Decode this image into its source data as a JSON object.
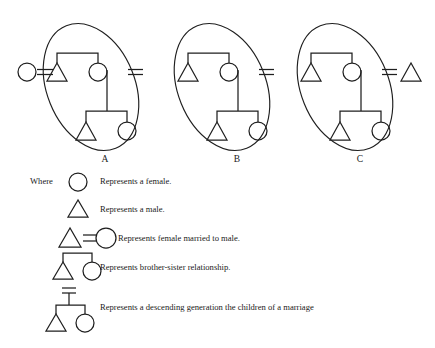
{
  "figure": {
    "title_visible": false,
    "background_color": "#ffffff",
    "stroke_color": "#1f1f1f"
  },
  "diagrams": [
    {
      "label": "A",
      "label_x": 105,
      "label_y": 160,
      "ellipse": {
        "cx": 91,
        "cy": 87,
        "rx": 44,
        "ry": 66,
        "rotate": -22
      },
      "external_spouse": {
        "symbol": "female-circle",
        "position": "left",
        "cx": 27,
        "cy": 72,
        "r": 9
      },
      "marriage_link_left": {
        "x1": 36,
        "x2": 54,
        "y": 72
      },
      "marriage_link_right": {
        "x1": 128,
        "x2": 142,
        "y": 72
      },
      "inside": {
        "sibling_bar": {
          "x1": 57,
          "x2": 98,
          "y": 53
        },
        "brother": {
          "symbol": "male-triangle",
          "cx": 57,
          "cy": 72
        },
        "sister": {
          "symbol": "female-circle",
          "cx": 98,
          "cy": 72,
          "r": 9
        },
        "descent_line": {
          "x": 107,
          "y1": 70,
          "y2": 111
        },
        "child_bar": {
          "x1": 86,
          "x2": 127,
          "y": 111
        },
        "son": {
          "symbol": "male-triangle",
          "cx": 86,
          "cy": 131
        },
        "daughter": {
          "symbol": "female-circle",
          "cx": 127,
          "cy": 131,
          "r": 9
        }
      }
    },
    {
      "label": "B",
      "label_x": 237,
      "label_y": 160,
      "ellipse": {
        "cx": 222,
        "cy": 87,
        "rx": 44,
        "ry": 66,
        "rotate": -22
      },
      "external_spouse": null,
      "marriage_link_left": null,
      "marriage_link_right": {
        "x1": 259,
        "x2": 273,
        "y": 72
      },
      "inside": {
        "sibling_bar": {
          "x1": 188,
          "x2": 229,
          "y": 53
        },
        "brother": {
          "symbol": "male-triangle",
          "cx": 188,
          "cy": 72
        },
        "sister": {
          "symbol": "female-circle",
          "cx": 229,
          "cy": 72,
          "r": 9
        },
        "descent_line": {
          "x": 238,
          "y1": 70,
          "y2": 111
        },
        "child_bar": {
          "x1": 217,
          "x2": 258,
          "y": 111
        },
        "son": {
          "symbol": "male-triangle",
          "cx": 217,
          "cy": 131
        },
        "daughter": {
          "symbol": "female-circle",
          "cx": 258,
          "cy": 131,
          "r": 9
        }
      }
    },
    {
      "label": "C",
      "label_x": 360,
      "label_y": 160,
      "ellipse": {
        "cx": 345,
        "cy": 87,
        "rx": 44,
        "ry": 66,
        "rotate": -22
      },
      "external_spouse": {
        "symbol": "male-triangle",
        "position": "right",
        "cx": 411,
        "cy": 72
      },
      "marriage_link_left": null,
      "marriage_link_right": {
        "x1": 381,
        "x2": 397,
        "y": 72
      },
      "inside": {
        "sibling_bar": {
          "x1": 311,
          "x2": 352,
          "y": 53
        },
        "brother": {
          "symbol": "male-triangle",
          "cx": 311,
          "cy": 72
        },
        "sister": {
          "symbol": "female-circle",
          "cx": 352,
          "cy": 72,
          "r": 9
        },
        "descent_line": {
          "x": 361,
          "y1": 70,
          "y2": 111
        },
        "child_bar": {
          "x1": 340,
          "x2": 381,
          "y": 111
        },
        "son": {
          "symbol": "male-triangle",
          "cx": 340,
          "cy": 131
        },
        "daughter": {
          "symbol": "female-circle",
          "cx": 381,
          "cy": 131,
          "r": 9
        }
      }
    }
  ],
  "legend": {
    "where_label": "Where",
    "where_x": 30,
    "where_y": 182,
    "items": [
      {
        "symbol": "female-circle",
        "text": "Represents a female.",
        "text_x": 100,
        "text_y": 182
      },
      {
        "symbol": "male-triangle",
        "text": "Represents a male.",
        "text_x": 100,
        "text_y": 209
      },
      {
        "symbol": "marriage-triangle-equals-circle",
        "text": "Represents female married to male.",
        "text_x": 118,
        "text_y": 239
      },
      {
        "symbol": "sibling-bracket-triangle-circle",
        "text": "Represents brother-sister relationship.",
        "text_x": 100,
        "text_y": 268
      },
      {
        "symbol": "descending-generation",
        "text": "Represents a descending generation the children of a marriage",
        "text_x": 100,
        "text_y": 310
      }
    ]
  }
}
